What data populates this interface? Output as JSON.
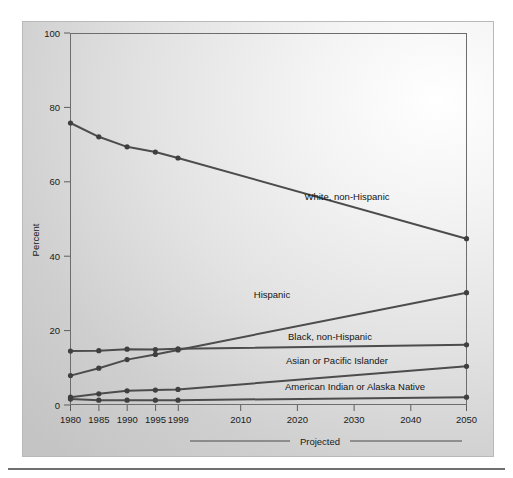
{
  "chart_data": {
    "type": "line",
    "title": "",
    "xlabel": "",
    "ylabel": "Percent",
    "xlim": [
      1980,
      2050
    ],
    "ylim": [
      0,
      100
    ],
    "grid": false,
    "legend_position": "inline-right",
    "x_tick_labels": [
      "1980",
      "1985",
      "1990",
      "1995",
      "1999",
      "2010",
      "2020",
      "2030",
      "2040",
      "2050"
    ],
    "x_tick_values": [
      1980,
      1985,
      1990,
      1995,
      1999,
      2010,
      2020,
      2030,
      2040,
      2050
    ],
    "y_tick_labels": [
      "0",
      "20",
      "40",
      "60",
      "80",
      "100"
    ],
    "y_tick_values": [
      0,
      20,
      40,
      60,
      80,
      100
    ],
    "annotation": "Projected",
    "annotation_range": [
      1999,
      2050
    ],
    "series": [
      {
        "name": "White, non-Hispanic",
        "label": "White, non-Hispanic",
        "x": [
          1980,
          1985,
          1990,
          1995,
          1999,
          2050
        ],
        "values": [
          75.8,
          72.1,
          69.4,
          68.0,
          66.4,
          44.7
        ]
      },
      {
        "name": "Hispanic",
        "label": "Hispanic",
        "x": [
          1980,
          1985,
          1990,
          1995,
          1999,
          2050
        ],
        "values": [
          7.9,
          9.9,
          12.2,
          13.6,
          14.8,
          30.2
        ]
      },
      {
        "name": "Black, non-Hispanic",
        "label": "Black, non-Hispanic",
        "x": [
          1980,
          1985,
          1990,
          1995,
          1999,
          2050
        ],
        "values": [
          14.5,
          14.6,
          15.0,
          14.9,
          15.1,
          16.2
        ]
      },
      {
        "name": "Asian or Pacific Islander",
        "label": "Asian or Pacific Islander",
        "x": [
          1980,
          1985,
          1990,
          1995,
          1999,
          2050
        ],
        "values": [
          2.1,
          3.0,
          3.8,
          4.0,
          4.2,
          10.4
        ]
      },
      {
        "name": "American Indian or Alaska Native",
        "label": "American Indian or Alaska Native",
        "x": [
          1980,
          1985,
          1990,
          1995,
          1999,
          2050
        ],
        "values": [
          1.6,
          1.3,
          1.3,
          1.3,
          1.3,
          2.1
        ]
      }
    ]
  },
  "labels": {
    "white": "White, non-Hispanic",
    "hispanic": "Hispanic",
    "black": "Black, non-Hispanic",
    "asian": "Asian or Pacific Islander",
    "amind": "American Indian or Alaska Native",
    "percent": "Percent",
    "projected": "Projected"
  },
  "ticks": {
    "y": [
      "100",
      "80",
      "60",
      "40",
      "20",
      "0"
    ],
    "x": [
      "1980",
      "1985",
      "1990",
      "1995",
      "1999",
      "2010",
      "2020",
      "2030",
      "2040",
      "2050"
    ]
  },
  "colors": {
    "line": "#4c4c4c",
    "text": "#1a1a1a",
    "panel_light": "#ffffff",
    "panel_dark": "#c4c4c4",
    "frame": "#6d6d6d"
  }
}
